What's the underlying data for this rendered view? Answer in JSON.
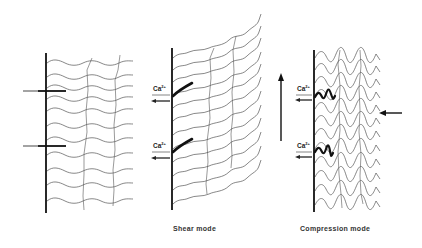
{
  "diagram": {
    "panels": [
      {
        "id": "resting",
        "caption": "",
        "description": "Wall with two transverse pins; wavy horizontal fibers with vertical cross-links"
      },
      {
        "id": "shear",
        "caption": "Shear mode",
        "ions": [
          {
            "label": "Ca",
            "charge": "2+"
          },
          {
            "label": "Ca",
            "charge": "2+"
          }
        ]
      },
      {
        "id": "compression",
        "caption": "Compression mode",
        "ions": [
          {
            "label": "Ca",
            "charge": "2+"
          },
          {
            "label": "Ca",
            "charge": "2+"
          }
        ]
      }
    ],
    "arrows": [
      {
        "name": "shear-upward-arrow",
        "direction": "up"
      },
      {
        "name": "compression-inward-arrow",
        "direction": "left"
      }
    ],
    "colors": {
      "wall": "#111111",
      "fiber": "#555555",
      "pin_gray": "#999999",
      "linker": "#111111"
    }
  }
}
